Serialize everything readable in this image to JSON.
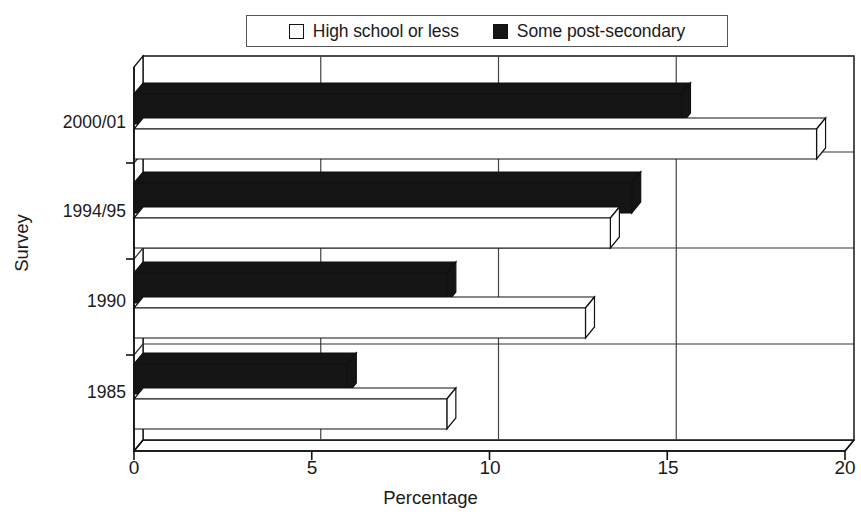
{
  "legend": {
    "position": "top-center",
    "entries": [
      {
        "label": "High school or less",
        "swatch": "white-square-outline",
        "color": "#ffffff"
      },
      {
        "label": "Some post-secondary",
        "swatch": "black-filled-square",
        "color": "#151515"
      }
    ]
  },
  "axes": {
    "x": {
      "title": "Percentage",
      "ticks": [
        "0",
        "5",
        "10",
        "15",
        "20"
      ],
      "min": 0,
      "max": 20
    },
    "y": {
      "title": "Survey",
      "ticks": [
        "2000/01",
        "1994/95",
        "1990",
        "1985"
      ]
    }
  },
  "chart_data": {
    "type": "bar",
    "orientation": "horizontal",
    "style": "3d-grouped-bar",
    "title": "",
    "xlabel": "Percentage",
    "ylabel": "Survey",
    "xlim": [
      0,
      20
    ],
    "xticks": [
      0,
      5,
      10,
      15,
      20
    ],
    "grid": true,
    "legend_position": "top-center",
    "categories": [
      "1985",
      "1990",
      "1994/95",
      "2000/01"
    ],
    "series": [
      {
        "name": "High school or less",
        "color": "#ffffff",
        "values": [
          8.8,
          12.7,
          13.4,
          19.2
        ]
      },
      {
        "name": "Some post-secondary",
        "color": "#151515",
        "values": [
          6.0,
          8.8,
          14.0,
          15.4
        ]
      }
    ]
  },
  "geometry": {
    "plot_left": 134,
    "plot_right": 845,
    "plot_top": 67,
    "plot_bottom": 451,
    "depth_dx": 9,
    "depth_dy": -11,
    "bar_thickness": 30,
    "bar_depth_dx": 9,
    "bar_depth_dy": -11,
    "row_centers": [
      123,
      212,
      302,
      393
    ]
  }
}
